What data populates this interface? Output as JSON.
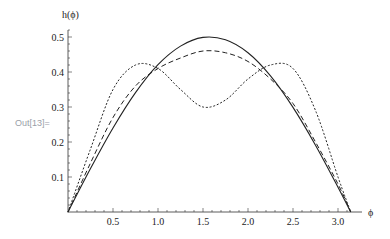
{
  "cell": {
    "out_label": "Out[13]="
  },
  "chart_data": {
    "type": "line",
    "title": "",
    "xlabel": "ϕ",
    "ylabel": "h(ϕ)",
    "xlim": [
      0,
      3.1416
    ],
    "ylim": [
      0,
      0.5
    ],
    "grid": false,
    "legend": null,
    "xticks": [
      "0.5",
      "1.0",
      "1.5",
      "2.0",
      "2.5",
      "3.0"
    ],
    "yticks": [
      "0.1",
      "0.2",
      "0.3",
      "0.4",
      "0.5"
    ],
    "x": [
      0,
      0.25,
      0.5,
      0.75,
      1.0,
      1.25,
      1.5,
      1.75,
      2.0,
      2.25,
      2.5,
      2.75,
      3.0,
      3.1416
    ],
    "series": [
      {
        "name": "solid",
        "style": "solid",
        "values": [
          0,
          0.124,
          0.24,
          0.341,
          0.421,
          0.474,
          0.499,
          0.492,
          0.455,
          0.389,
          0.299,
          0.191,
          0.071,
          0
        ]
      },
      {
        "name": "dashed",
        "style": "dashed",
        "values": [
          0,
          0.14,
          0.27,
          0.36,
          0.41,
          0.44,
          0.46,
          0.455,
          0.43,
          0.38,
          0.31,
          0.2,
          0.08,
          0
        ]
      },
      {
        "name": "dotted",
        "style": "dotted",
        "values": [
          0,
          0.18,
          0.35,
          0.42,
          0.41,
          0.35,
          0.3,
          0.32,
          0.38,
          0.42,
          0.41,
          0.29,
          0.1,
          0
        ]
      }
    ]
  }
}
